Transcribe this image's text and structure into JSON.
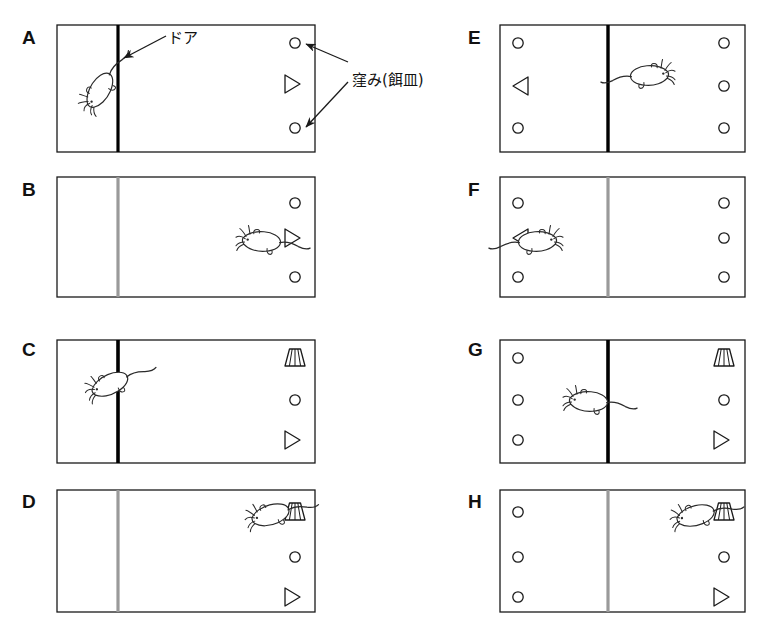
{
  "figure": {
    "panel_count": 8,
    "annotations": [
      {
        "id": "door-label",
        "text": "ドア",
        "x": 168,
        "y": 30
      },
      {
        "id": "well-label",
        "text": "窪み(餌皿)",
        "x": 352,
        "y": 72
      }
    ],
    "colors": {
      "outline": "#1a1a1a",
      "door_closed": "#000000",
      "door_open": "#9a9a9a",
      "label": "#111111",
      "background": "#ffffff"
    },
    "legend_terms": {
      "door": "ドア",
      "well_food_dish": "窪み(餌皿)"
    },
    "panels": [
      {
        "letter": "A",
        "letter_x": 22,
        "letter_y": 28,
        "box": {
          "x": 57,
          "y": 25,
          "w": 258,
          "h": 127
        },
        "door": {
          "x": 118,
          "state": "closed",
          "width": 3.2
        },
        "rat": {
          "x": 88,
          "y": 105,
          "facing": "up-left",
          "rotation": -62
        },
        "wells": [
          {
            "shape": "circle",
            "x": 295,
            "y": 43
          },
          {
            "shape": "triangle",
            "x": 292,
            "y": 84,
            "direction": "right"
          },
          {
            "shape": "circle",
            "x": 295,
            "y": 128
          }
        ]
      },
      {
        "letter": "B",
        "letter_x": 22,
        "letter_y": 180,
        "box": {
          "x": 57,
          "y": 177,
          "w": 258,
          "h": 120
        },
        "door": {
          "x": 118,
          "state": "open",
          "width": 3.2
        },
        "rat": {
          "x": 243,
          "y": 238,
          "facing": "right",
          "rotation": 0
        },
        "wells": [
          {
            "shape": "circle",
            "x": 295,
            "y": 203
          },
          {
            "shape": "triangle",
            "x": 292,
            "y": 238,
            "direction": "right"
          },
          {
            "shape": "circle",
            "x": 295,
            "y": 277
          }
        ]
      },
      {
        "letter": "C",
        "letter_x": 22,
        "letter_y": 340,
        "box": {
          "x": 57,
          "y": 340,
          "w": 258,
          "h": 123
        },
        "door": {
          "x": 118,
          "state": "closed",
          "width": 3.6
        },
        "rat": {
          "x": 92,
          "y": 390,
          "facing": "up-right",
          "rotation": -28
        },
        "wells": [
          {
            "shape": "fan",
            "x": 295,
            "y": 358
          },
          {
            "shape": "circle",
            "x": 295,
            "y": 400
          },
          {
            "shape": "triangle",
            "x": 292,
            "y": 440,
            "direction": "right"
          }
        ]
      },
      {
        "letter": "D",
        "letter_x": 22,
        "letter_y": 492,
        "box": {
          "x": 57,
          "y": 490,
          "w": 258,
          "h": 122
        },
        "door": {
          "x": 118,
          "state": "open",
          "width": 3.2
        },
        "rat": {
          "x": 252,
          "y": 518,
          "facing": "up-right",
          "rotation": -20
        },
        "wells": [
          {
            "shape": "fan",
            "x": 295,
            "y": 512
          },
          {
            "shape": "circle",
            "x": 295,
            "y": 557
          },
          {
            "shape": "triangle",
            "x": 292,
            "y": 597,
            "direction": "right"
          }
        ]
      },
      {
        "letter": "E",
        "letter_x": 468,
        "letter_y": 28,
        "box": {
          "x": 500,
          "y": 25,
          "w": 245,
          "h": 127
        },
        "door": {
          "x": 608,
          "state": "closed",
          "width": 3.4
        },
        "rat": {
          "x": 668,
          "y": 72,
          "facing": "left",
          "rotation": 0,
          "mirrored": true
        },
        "wells": [
          {
            "shape": "circle",
            "x": 518,
            "y": 43
          },
          {
            "shape": "triangle",
            "x": 521,
            "y": 86,
            "direction": "left"
          },
          {
            "shape": "circle",
            "x": 518,
            "y": 128
          },
          {
            "shape": "circle",
            "x": 724,
            "y": 43
          },
          {
            "shape": "circle",
            "x": 724,
            "y": 86
          },
          {
            "shape": "circle",
            "x": 724,
            "y": 128
          }
        ]
      },
      {
        "letter": "F",
        "letter_x": 468,
        "letter_y": 180,
        "box": {
          "x": 500,
          "y": 177,
          "w": 245,
          "h": 120
        },
        "door": {
          "x": 608,
          "state": "open",
          "width": 3.2
        },
        "rat": {
          "x": 556,
          "y": 238,
          "facing": "left",
          "rotation": 0,
          "mirrored": true
        },
        "wells": [
          {
            "shape": "circle",
            "x": 518,
            "y": 203
          },
          {
            "shape": "triangle",
            "x": 521,
            "y": 238,
            "direction": "left"
          },
          {
            "shape": "circle",
            "x": 518,
            "y": 277
          },
          {
            "shape": "circle",
            "x": 724,
            "y": 203
          },
          {
            "shape": "circle",
            "x": 724,
            "y": 238
          },
          {
            "shape": "circle",
            "x": 724,
            "y": 277
          }
        ]
      },
      {
        "letter": "G",
        "letter_x": 468,
        "letter_y": 340,
        "box": {
          "x": 500,
          "y": 340,
          "w": 245,
          "h": 123
        },
        "door": {
          "x": 608,
          "state": "closed",
          "width": 3.6
        },
        "rat": {
          "x": 570,
          "y": 398,
          "facing": "right",
          "rotation": 0
        },
        "wells": [
          {
            "shape": "circle",
            "x": 518,
            "y": 358
          },
          {
            "shape": "circle",
            "x": 518,
            "y": 400
          },
          {
            "shape": "circle",
            "x": 518,
            "y": 440
          },
          {
            "shape": "fan",
            "x": 724,
            "y": 358
          },
          {
            "shape": "circle",
            "x": 724,
            "y": 400
          },
          {
            "shape": "triangle",
            "x": 721,
            "y": 440,
            "direction": "right"
          }
        ]
      },
      {
        "letter": "H",
        "letter_x": 468,
        "letter_y": 492,
        "box": {
          "x": 500,
          "y": 490,
          "w": 245,
          "h": 122
        },
        "door": {
          "x": 608,
          "state": "open",
          "width": 3.2
        },
        "rat": {
          "x": 677,
          "y": 518,
          "facing": "up-right",
          "rotation": -18
        },
        "wells": [
          {
            "shape": "circle",
            "x": 518,
            "y": 512
          },
          {
            "shape": "circle",
            "x": 518,
            "y": 557
          },
          {
            "shape": "circle",
            "x": 518,
            "y": 597
          },
          {
            "shape": "fan",
            "x": 724,
            "y": 512
          },
          {
            "shape": "circle",
            "x": 724,
            "y": 557
          },
          {
            "shape": "triangle",
            "x": 721,
            "y": 597,
            "direction": "right"
          }
        ]
      }
    ],
    "arrows": [
      {
        "id": "door-arrow",
        "x1": 166,
        "y1": 36,
        "x2": 124,
        "y2": 58
      },
      {
        "id": "well-arrow-top",
        "x1": 348,
        "y1": 62,
        "x2": 306,
        "y2": 44
      },
      {
        "id": "well-arrow-bottom",
        "x1": 348,
        "y1": 82,
        "x2": 306,
        "y2": 127
      }
    ]
  }
}
